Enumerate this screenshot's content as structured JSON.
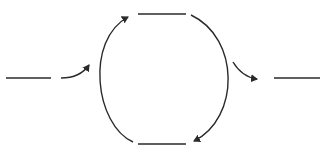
{
  "diagram": {
    "type": "cycle-with-input-output",
    "colors": {
      "stroke": "#2a2a2a",
      "background": "#ffffff"
    },
    "nodes": [
      {
        "id": "input",
        "shape": "blank-line",
        "label": ""
      },
      {
        "id": "top",
        "shape": "blank-line",
        "label": ""
      },
      {
        "id": "bottom",
        "shape": "blank-line",
        "label": ""
      },
      {
        "id": "output",
        "shape": "blank-line",
        "label": ""
      }
    ],
    "edges": [
      {
        "from": "input",
        "to": "cycle-left-arc",
        "style": "curved-arrow"
      },
      {
        "from": "bottom",
        "to": "top",
        "style": "arc-arrow",
        "side": "left"
      },
      {
        "from": "top",
        "to": "bottom",
        "style": "arc-arrow",
        "side": "right"
      },
      {
        "from": "cycle-right-arc",
        "to": "output",
        "style": "curved-arrow"
      }
    ]
  }
}
